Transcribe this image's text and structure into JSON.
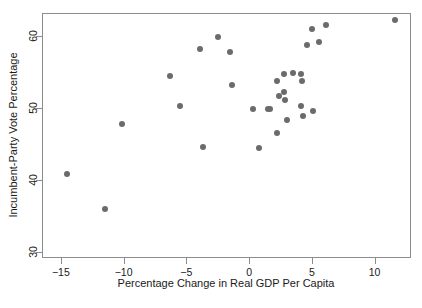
{
  "chart_data": {
    "type": "scatter",
    "title": "",
    "xlabel": "Percentage Change in Real GDP Per Capita",
    "ylabel": "Incumbent-Party Vote Percentage",
    "xlim": [
      -16.5,
      12.9
    ],
    "ylim": [
      29.1,
      63.2
    ],
    "xticks": [
      -15,
      -10,
      -5,
      0,
      5,
      10
    ],
    "xtick_labels": [
      "−15",
      "−10",
      "−5",
      "0",
      "5",
      "10"
    ],
    "yticks": [
      30,
      40,
      50,
      60
    ],
    "ytick_labels": [
      "30",
      "40",
      "50",
      "60"
    ],
    "grid": false,
    "legend": null,
    "marker": {
      "shape": "circle",
      "color": "#6b6b6b",
      "size_px": 6
    },
    "frame_color": "#8c8c8c",
    "background": "#ffffff",
    "n_points": 31,
    "points": [
      {
        "x": -14.5,
        "y": 40.8
      },
      {
        "x": -11.5,
        "y": 35.9
      },
      {
        "x": -10.1,
        "y": 47.8
      },
      {
        "x": -6.3,
        "y": 54.5
      },
      {
        "x": -5.5,
        "y": 50.3
      },
      {
        "x": -3.9,
        "y": 58.2
      },
      {
        "x": -3.7,
        "y": 44.6
      },
      {
        "x": -2.5,
        "y": 59.9
      },
      {
        "x": -1.5,
        "y": 57.8
      },
      {
        "x": -1.4,
        "y": 53.2
      },
      {
        "x": 0.3,
        "y": 49.8
      },
      {
        "x": 0.8,
        "y": 44.4
      },
      {
        "x": 1.5,
        "y": 49.8
      },
      {
        "x": 1.7,
        "y": 49.8
      },
      {
        "x": 2.2,
        "y": 53.8
      },
      {
        "x": 2.2,
        "y": 46.5
      },
      {
        "x": 2.4,
        "y": 51.6
      },
      {
        "x": 2.8,
        "y": 54.7
      },
      {
        "x": 2.8,
        "y": 52.2
      },
      {
        "x": 2.9,
        "y": 51.1
      },
      {
        "x": 3.0,
        "y": 48.3
      },
      {
        "x": 3.5,
        "y": 54.9
      },
      {
        "x": 4.1,
        "y": 54.7
      },
      {
        "x": 4.1,
        "y": 50.2
      },
      {
        "x": 4.2,
        "y": 53.7
      },
      {
        "x": 4.3,
        "y": 48.9
      },
      {
        "x": 4.6,
        "y": 58.7
      },
      {
        "x": 5.0,
        "y": 61.0
      },
      {
        "x": 5.1,
        "y": 49.5
      },
      {
        "x": 5.6,
        "y": 59.1
      },
      {
        "x": 6.1,
        "y": 61.5
      },
      {
        "x": 11.6,
        "y": 62.2
      }
    ]
  }
}
